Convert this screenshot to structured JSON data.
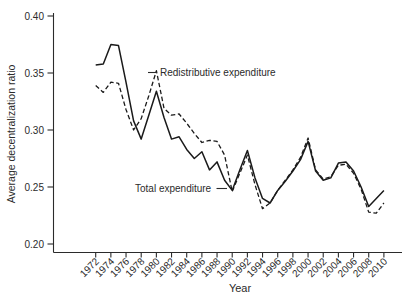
{
  "chart_data": {
    "type": "line",
    "title": "",
    "xlabel": "Year",
    "ylabel": "Average decentralization ratio",
    "ylim": [
      0.2,
      0.4
    ],
    "yticks": [
      0.4,
      0.35,
      0.3,
      0.25,
      0.2
    ],
    "xtick_years": [
      1972,
      1974,
      1976,
      1978,
      1980,
      1982,
      1984,
      1986,
      1988,
      1990,
      1992,
      1994,
      1996,
      1998,
      2000,
      2002,
      2004,
      2006,
      2008,
      2010
    ],
    "x": [
      1972,
      1973,
      1974,
      1975,
      1976,
      1977,
      1978,
      1979,
      1980,
      1981,
      1982,
      1983,
      1984,
      1985,
      1986,
      1987,
      1988,
      1989,
      1990,
      1991,
      1992,
      1993,
      1994,
      1995,
      1996,
      1997,
      1998,
      1999,
      2000,
      2001,
      2002,
      2003,
      2004,
      2005,
      2006,
      2007,
      2008,
      2009,
      2010
    ],
    "series": [
      {
        "name": "Redistributive expenditure",
        "style": "dashed",
        "values": [
          0.339,
          0.333,
          0.342,
          0.341,
          0.318,
          0.3,
          0.31,
          0.33,
          0.352,
          0.319,
          0.313,
          0.314,
          0.306,
          0.297,
          0.289,
          0.291,
          0.29,
          0.278,
          0.246,
          0.262,
          0.278,
          0.252,
          0.231,
          0.236,
          0.247,
          0.256,
          0.265,
          0.276,
          0.293,
          0.265,
          0.257,
          0.259,
          0.269,
          0.27,
          0.262,
          0.248,
          0.228,
          0.227,
          0.236
        ]
      },
      {
        "name": "Total expenditure",
        "style": "solid",
        "values": [
          0.357,
          0.358,
          0.375,
          0.374,
          0.342,
          0.308,
          0.292,
          0.313,
          0.334,
          0.311,
          0.292,
          0.294,
          0.283,
          0.275,
          0.281,
          0.265,
          0.272,
          0.256,
          0.247,
          0.265,
          0.282,
          0.258,
          0.24,
          0.236,
          0.247,
          0.255,
          0.264,
          0.274,
          0.29,
          0.264,
          0.256,
          0.258,
          0.271,
          0.272,
          0.264,
          0.25,
          0.233,
          0.24,
          0.247
        ]
      }
    ],
    "annotations": [
      {
        "text": "Redistributive expenditure",
        "points_to": "dashed line peak at 1980"
      },
      {
        "text": "Total expenditure",
        "points_to": "solid line trough near 1990"
      }
    ],
    "grid": false,
    "legend_position": "inline-annotations",
    "colors": {
      "line": "#1a1a1a",
      "text": "#2b2b2b",
      "background": "#ffffff"
    }
  }
}
